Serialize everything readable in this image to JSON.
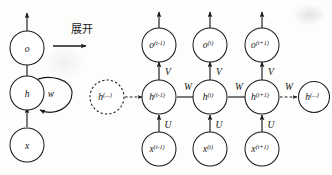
{
  "figure": {
    "title_text": "展开",
    "arrow_label": "展开",
    "background_color": "#fdfdfc",
    "ink_color": "#1a1a1a"
  },
  "folded_network": {
    "output_node": {
      "label": "o",
      "sup": ""
    },
    "hidden_node": {
      "label": "h",
      "sup": ""
    },
    "input_node": {
      "label": "x",
      "sup": ""
    },
    "self_loop_label": "w",
    "edges": [
      {
        "from": "x",
        "to": "h",
        "label": ""
      },
      {
        "from": "h",
        "to": "o",
        "label": ""
      },
      {
        "from": "o",
        "to": "out",
        "label": ""
      },
      {
        "from": "h",
        "to": "h",
        "label": "w"
      }
    ]
  },
  "unfolded_network": {
    "ellipsis_left": {
      "label": "h",
      "sup": "(...)"
    },
    "ellipsis_right": {
      "label": "h",
      "sup": "(...)"
    },
    "weights": {
      "input": "U",
      "recurrent": "W",
      "output": "V"
    },
    "timesteps": [
      {
        "output": {
          "label": "o",
          "sup": "(t-1)"
        },
        "hidden": {
          "label": "h",
          "sup": "(t-1)"
        },
        "input": {
          "label": "x",
          "sup": "(t-1)"
        },
        "w_in": "U",
        "w_out": "V",
        "w_rec": "W"
      },
      {
        "output": {
          "label": "o",
          "sup": "(t)"
        },
        "hidden": {
          "label": "h",
          "sup": "(t)"
        },
        "input": {
          "label": "x",
          "sup": "(t)"
        },
        "w_in": "U",
        "w_out": "V",
        "w_rec": "W"
      },
      {
        "output": {
          "label": "o",
          "sup": "(t+1)"
        },
        "hidden": {
          "label": "h",
          "sup": "(t+1)"
        },
        "input": {
          "label": "x",
          "sup": "(t+1)"
        },
        "w_in": "U",
        "w_out": "V",
        "w_rec": "W"
      }
    ]
  }
}
